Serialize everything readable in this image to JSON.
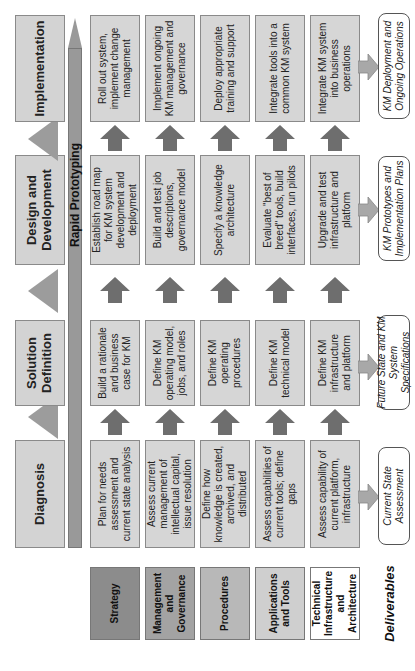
{
  "phases": [
    "Diagnosis",
    "Solution Definition",
    "Design and Development",
    "Implementation"
  ],
  "rapid_prototyping": "Rapid Prototyping",
  "rows": [
    {
      "label": "Strategy",
      "color": "#8c8c8c",
      "cells": [
        "Plan for needs assessment and current state analysis",
        "Build a rationale and business case for KM",
        "Establish road map for KM system development and deployment",
        "Roll out system, implement change management"
      ]
    },
    {
      "label": "Management and Governance",
      "color": "#a3a3a3",
      "cells": [
        "Assess current management of intellectual capital, issue resolution",
        "Define KM operating model, jobs, and roles",
        "Build and test job descriptions, governance model",
        "Implement ongoing KM management and governance"
      ]
    },
    {
      "label": "Procedures",
      "color": "#b8b8b8",
      "cells": [
        "Define how knowledge is created, archived, and distributed",
        "Define KM operating procedures",
        "Specify a knowledge architecture",
        "Deploy appropriate training and support"
      ]
    },
    {
      "label": "Applications and Tools",
      "color": "#cfcfcf",
      "cells": [
        "Assess capabilities of current tools; define gaps",
        "Define KM technical model",
        "Evaluate \"best of breed\" tools, build interfaces, run pilots",
        "Integrate tools into a common KM system"
      ]
    },
    {
      "label": "Technical Infrastructure and Architecture",
      "color": "#ffffff",
      "cells": [
        "Assess capability of current platform, infrastructure",
        "Define KM infrastructure and platform",
        "Upgrade and test infrastructure and platform",
        "Integrate KM system into business operations"
      ]
    }
  ],
  "deliverables": {
    "label": "Deliverables",
    "items": [
      "Current State Assessment",
      "Future State and KM System Specifications",
      "KM Prototypes and Implementation Plans",
      "KM Deployment and Ongoing Operations"
    ]
  }
}
